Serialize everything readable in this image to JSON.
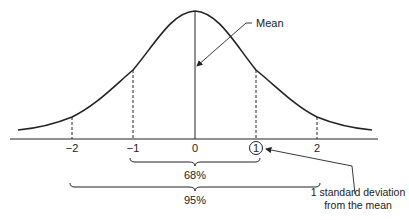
{
  "figure": {
    "type": "normal-distribution-diagram",
    "mean_label": "Mean",
    "axis": {
      "ticks": [
        {
          "value": -2,
          "label": "−2"
        },
        {
          "value": -1,
          "label": "−1"
        },
        {
          "value": 0,
          "label": "0"
        },
        {
          "value": 1,
          "label": "1"
        },
        {
          "value": 2,
          "label": "2"
        }
      ]
    },
    "brackets": {
      "one_sd": {
        "range": [
          -1,
          1
        ],
        "label": "68%"
      },
      "two_sd": {
        "range": [
          -2,
          2
        ],
        "label": "95%"
      }
    },
    "annotation": {
      "line1": "1 standard deviation",
      "line2": "from the mean",
      "circled_tick": "1"
    },
    "colors": {
      "stroke": "#222222",
      "background": "#ffffff"
    }
  }
}
